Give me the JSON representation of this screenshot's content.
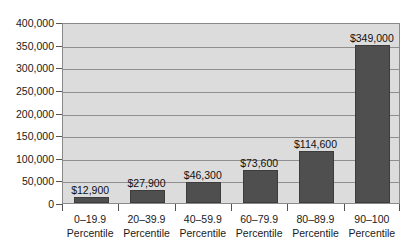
{
  "chart_data": {
    "type": "bar",
    "title": "",
    "subtitle": "",
    "xlabel": "",
    "ylabel": "",
    "categories": [
      "0–19.9 Percentile",
      "20–39.9 Percentile",
      "40–59.9 Percentile",
      "60–79.9 Percentile",
      "80–89.9 Percentile",
      "90–100 Percentile"
    ],
    "category_ranges": [
      "0–19.9",
      "20–39.9",
      "40–59.9",
      "60–79.9",
      "80–89.9",
      "90–100"
    ],
    "category_units": [
      "Percentile",
      "Percentile",
      "Percentile",
      "Percentile",
      "Percentile",
      "Percentile"
    ],
    "values": [
      12900,
      27900,
      46300,
      73600,
      114600,
      349000
    ],
    "value_labels": [
      "$12,900",
      "$27,900",
      "$46,300",
      "$73,600",
      "$114,600",
      "$349,000"
    ],
    "ylim": [
      0,
      400000
    ],
    "y_ticks": [
      0,
      50000,
      100000,
      150000,
      200000,
      250000,
      300000,
      350000,
      400000
    ],
    "y_tick_labels": [
      "0",
      "50,000",
      "100,000",
      "150,000",
      "200,000",
      "250,000",
      "300,000",
      "350,000",
      "400,000"
    ],
    "grid": true,
    "legend": false,
    "legend_position": "none",
    "colors": {
      "bar_fill": "#4f4f4f",
      "bar_edge": "#3c3c3c",
      "plot_background": "#dcdcdc",
      "gridline": "#8f8f8f",
      "axis": "#555555",
      "text": "#1a1a1a",
      "page_background": "#ffffff"
    }
  }
}
